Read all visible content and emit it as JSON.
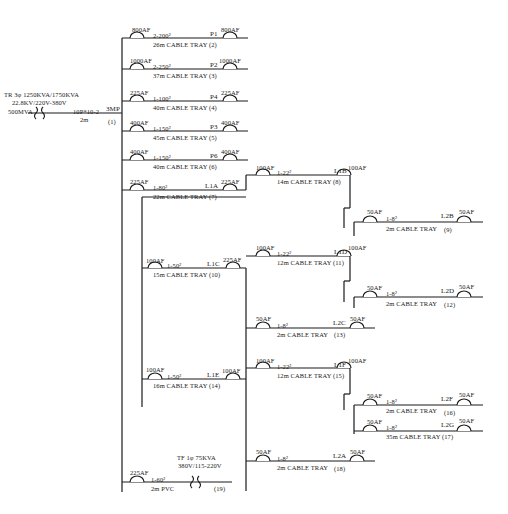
{
  "diagram": {
    "type": "single-line electrical distribution diagram",
    "source": {
      "transformer": "TR 3φ 1250KVA/1750KVA",
      "voltage": "22.8KV/220V-380V",
      "fault_level": "500MVA",
      "cable": "10P*10-2",
      "length": "2m",
      "panel": "3MP",
      "circuit": "(1)"
    },
    "feeders": [
      {
        "id": "f2",
        "breaker_in": "800AF",
        "cable": "2-200²",
        "panel": "P1",
        "breaker_out": "800AF",
        "route": "26m CABLE TRAY (2)"
      },
      {
        "id": "f3",
        "breaker_in": "1000AF",
        "cable": "2-250²",
        "panel": "P2",
        "breaker_out": "1000AF",
        "route": "37m CABLE TRAY (3)"
      },
      {
        "id": "f4",
        "breaker_in": "225AF",
        "cable": "1-100²",
        "panel": "P4",
        "breaker_out": "225AF",
        "route": "40m CABLE TRAY (4)"
      },
      {
        "id": "f5",
        "breaker_in": "400AF",
        "cable": "1-150²",
        "panel": "P3",
        "breaker_out": "400AF",
        "route": "45m CABLE TRAY (5)"
      },
      {
        "id": "f6",
        "breaker_in": "400AF",
        "cable": "1-150²",
        "panel": "P6",
        "breaker_out": "400AF",
        "route": "40m CABLE TRAY (6)"
      },
      {
        "id": "f7",
        "breaker_in": "225AF",
        "cable": "1-80²",
        "panel": "L1A",
        "breaker_out": "225AF",
        "route": "22m CABLE TRAY (7)"
      },
      {
        "id": "f8",
        "breaker_in": "100AF",
        "cable": "1-22²",
        "panel": "L1B",
        "breaker_out": "100AF",
        "route": "14m CABLE TRAY (8)"
      },
      {
        "id": "f9",
        "breaker_in": "50AF",
        "cable": "1-8²",
        "panel": "L2B",
        "breaker_out": "50AF",
        "route": "2m CABLE TRAY",
        "num": "(9)"
      },
      {
        "id": "f10",
        "breaker_in": "100AF",
        "cable": "1-50²",
        "panel": "L1C",
        "breaker_out": "225AF",
        "route": "15m CABLE TRAY (10)"
      },
      {
        "id": "f11",
        "breaker_in": "100AF",
        "cable": "1-22²",
        "panel": "L1D",
        "breaker_out": "100AF",
        "route": "12m CABLE TRAY (11)"
      },
      {
        "id": "f12",
        "breaker_in": "50AF",
        "cable": "1-8²",
        "panel": "L2D",
        "breaker_out": "50AF",
        "route": "2m CABLE TRAY",
        "num": "(12)"
      },
      {
        "id": "f13",
        "breaker_in": "50AF",
        "cable": "1-8²",
        "panel": "L2C",
        "breaker_out": "50AF",
        "route": "2m CABLE TRAY",
        "num": "(13)"
      },
      {
        "id": "f14",
        "breaker_in": "100AF",
        "cable": "1-50²",
        "panel": "L1E",
        "breaker_out": "100AF",
        "route": "16m CABLE TRAY (14)"
      },
      {
        "id": "f15",
        "breaker_in": "100AF",
        "cable": "1-22²",
        "panel": "L1F",
        "breaker_out": "100AF",
        "route": "12m CABLE TRAY (15)"
      },
      {
        "id": "f16",
        "breaker_in": "50AF",
        "cable": "1-8²",
        "panel": "L2F",
        "breaker_out": "50AF",
        "route": "2m CABLE TRAY",
        "num": "(16)"
      },
      {
        "id": "f17",
        "breaker_in": "50AF",
        "cable": "1-8²",
        "panel": "L2G",
        "breaker_out": "50AF",
        "route": "35m CABLE TRAY (17)"
      },
      {
        "id": "f18",
        "breaker_in": "50AF",
        "cable": "1-8²",
        "panel": "L2A",
        "breaker_out": "50AF",
        "route": "2m CABLE TRAY",
        "num": "(18)"
      }
    ],
    "aux_transformer": {
      "breaker": "225AF",
      "cable": "1-60²",
      "route": "2m PVC",
      "label": "TF 1φ 75KVA",
      "voltage": "380V/115-220V",
      "num": "(19)"
    }
  }
}
